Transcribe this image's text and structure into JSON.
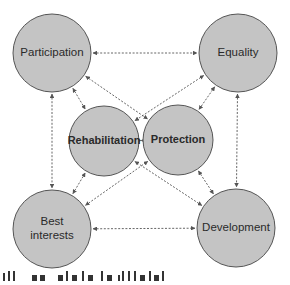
{
  "diagram": {
    "type": "relationship-network",
    "colors": {
      "node_fill": "#c4c4c4",
      "node_stroke": "#555555",
      "edge": "#555555",
      "text": "#2a2a2a",
      "background": "#ffffff"
    },
    "nodes": [
      {
        "id": "participation",
        "label": "Participation",
        "lines": [
          "Participation"
        ],
        "cx": 52,
        "cy": 53,
        "r": 39,
        "group": "outer"
      },
      {
        "id": "equality",
        "label": "Equality",
        "lines": [
          "Equality"
        ],
        "cx": 238,
        "cy": 53,
        "r": 39,
        "group": "outer"
      },
      {
        "id": "best_interests",
        "label": "Best interests",
        "lines": [
          "Best",
          "interests"
        ],
        "cx": 52,
        "cy": 229,
        "r": 39,
        "group": "outer"
      },
      {
        "id": "development",
        "label": "Development",
        "lines": [
          "Development"
        ],
        "cx": 236,
        "cy": 228,
        "r": 39,
        "group": "outer"
      },
      {
        "id": "rehabilitation",
        "label": "Rehabilitation",
        "lines": [
          "Rehabilitation"
        ],
        "cx": 104,
        "cy": 141,
        "r": 35,
        "group": "inner"
      },
      {
        "id": "protection",
        "label": "Protection",
        "lines": [
          "Protection"
        ],
        "cx": 178,
        "cy": 140,
        "r": 35,
        "group": "inner"
      }
    ],
    "edges": [
      {
        "from": "participation",
        "to": "equality",
        "style": "dashed",
        "arrows": "both"
      },
      {
        "from": "participation",
        "to": "best_interests",
        "style": "dashed",
        "arrows": "both"
      },
      {
        "from": "equality",
        "to": "development",
        "style": "dashed",
        "arrows": "both"
      },
      {
        "from": "best_interests",
        "to": "development",
        "style": "dashed",
        "arrows": "both"
      },
      {
        "from": "participation",
        "to": "rehabilitation",
        "style": "dashed",
        "arrows": "both"
      },
      {
        "from": "participation",
        "to": "protection",
        "style": "dashed",
        "arrows": "both"
      },
      {
        "from": "equality",
        "to": "rehabilitation",
        "style": "dashed",
        "arrows": "both"
      },
      {
        "from": "equality",
        "to": "protection",
        "style": "dashed",
        "arrows": "both"
      },
      {
        "from": "best_interests",
        "to": "rehabilitation",
        "style": "dashed",
        "arrows": "both"
      },
      {
        "from": "best_interests",
        "to": "protection",
        "style": "dashed",
        "arrows": "both"
      },
      {
        "from": "development",
        "to": "rehabilitation",
        "style": "dashed",
        "arrows": "both"
      },
      {
        "from": "development",
        "to": "protection",
        "style": "dashed",
        "arrows": "both"
      },
      {
        "from": "rehabilitation",
        "to": "protection",
        "style": "dashed",
        "arrows": "both"
      }
    ]
  },
  "caption": {
    "text": "...all ... ... ... the ... of ... child ... ... ...",
    "note": "partially cropped text at bottom edge; only tops of glyphs visible"
  }
}
